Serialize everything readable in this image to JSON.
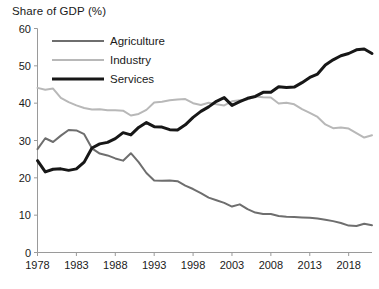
{
  "chart_data": {
    "type": "line",
    "title": "Share of GDP (%)",
    "xlabel": "",
    "ylabel": "Share of GDP (%)",
    "xlim": [
      1978,
      2021
    ],
    "ylim": [
      0,
      60
    ],
    "ytick_step": 10,
    "grid": false,
    "legend_position": "top-left",
    "yticks": [
      "0",
      "10",
      "20",
      "30",
      "40",
      "50",
      "60"
    ],
    "xticks": [
      "1978",
      "1983",
      "1988",
      "1993",
      "1998",
      "2003",
      "2008",
      "2013",
      "2018"
    ],
    "x": [
      1978,
      1979,
      1980,
      1981,
      1982,
      1983,
      1984,
      1985,
      1986,
      1987,
      1988,
      1989,
      1990,
      1991,
      1992,
      1993,
      1994,
      1995,
      1996,
      1997,
      1998,
      1999,
      2000,
      2001,
      2002,
      2003,
      2004,
      2005,
      2006,
      2007,
      2008,
      2009,
      2010,
      2011,
      2012,
      2013,
      2014,
      2015,
      2016,
      2017,
      2018,
      2019,
      2020,
      2021
    ],
    "series": [
      {
        "name": "Agriculture",
        "color": "#6e6e6e",
        "width": 2.0,
        "values": [
          27.7,
          30.6,
          29.6,
          31.3,
          32.8,
          32.7,
          31.7,
          27.9,
          26.5,
          26.0,
          25.2,
          24.6,
          26.6,
          24.2,
          21.3,
          19.3,
          19.2,
          19.3,
          19.1,
          17.9,
          17.0,
          15.9,
          14.7,
          14.0,
          13.3,
          12.3,
          12.9,
          11.6,
          10.7,
          10.3,
          10.3,
          9.8,
          9.6,
          9.5,
          9.4,
          9.3,
          9.1,
          8.8,
          8.4,
          7.9,
          7.2,
          7.1,
          7.7,
          7.3
        ]
      },
      {
        "name": "Industry",
        "color": "#b8b8b8",
        "width": 2.0,
        "values": [
          44.1,
          43.6,
          43.9,
          41.4,
          40.3,
          39.4,
          38.7,
          38.3,
          38.4,
          38.1,
          38.1,
          38.0,
          36.7,
          37.1,
          38.2,
          40.2,
          40.4,
          40.8,
          41.0,
          41.1,
          40.0,
          39.5,
          40.1,
          39.7,
          39.4,
          40.5,
          40.8,
          41.0,
          41.8,
          41.6,
          41.5,
          39.9,
          40.1,
          39.7,
          38.4,
          37.4,
          36.3,
          34.3,
          33.3,
          33.5,
          33.2,
          32.0,
          30.8,
          31.4
        ]
      },
      {
        "name": "Services",
        "color": "#171717",
        "width": 3.0,
        "values": [
          24.6,
          21.6,
          22.3,
          22.4,
          22.0,
          22.4,
          24.2,
          28.0,
          29.1,
          29.5,
          30.5,
          32.1,
          31.5,
          33.5,
          34.8,
          33.7,
          33.6,
          32.9,
          32.8,
          34.2,
          36.2,
          37.8,
          39.0,
          40.5,
          41.5,
          39.4,
          40.4,
          41.3,
          41.8,
          42.9,
          42.9,
          44.4,
          44.2,
          44.3,
          45.5,
          46.9,
          47.8,
          50.2,
          51.6,
          52.7,
          53.3,
          54.3,
          54.5,
          53.3
        ]
      }
    ],
    "legend": [
      {
        "label": "Agriculture",
        "color": "#6e6e6e",
        "width": 2.0
      },
      {
        "label": "Industry",
        "color": "#b8b8b8",
        "width": 2.0
      },
      {
        "label": "Services",
        "color": "#171717",
        "width": 3.0
      }
    ]
  },
  "axis": {
    "color": "#9a9a9a"
  }
}
